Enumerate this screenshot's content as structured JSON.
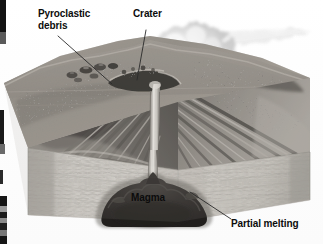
{
  "figure": {
    "type": "labeled-illustration",
    "width": 323,
    "height": 244,
    "background_color": "#ffffff",
    "rendering": "grayscale photographic airbrush illustration"
  },
  "labels": {
    "pyroclastic_debris": "Pyroclastic\ndebris",
    "crater": "Crater",
    "magma": "Magma",
    "partial_melting": "Partial melting"
  },
  "label_color": "#0c0c0c",
  "leader_line_color": "#2a2a2a",
  "parts": {
    "ash_plume": "ash-plume",
    "summit_crater": "summit-crater",
    "volcanic_cone": "volcanic-cone",
    "pyroclastic_layers": "pyroclastic-layers",
    "lava_layers": "lava-layers",
    "central_conduit": "central-conduit",
    "crust_block": "crust-block",
    "magma_chamber": "magma-chamber",
    "partial_melt_zone": "partial-melt-zone",
    "scan_artifact": "left-edge-scan-strip"
  },
  "palette": {
    "sky": "#ffffff",
    "plume_light": "#f0f0f0",
    "plume_mid": "#cfcfcf",
    "cone_light": "#b8b4ae",
    "cone_mid": "#8e8a85",
    "cone_dark": "#5a5752",
    "crust_light": "#d9d6d1",
    "crust_mid": "#c2bfb9",
    "crust_shadow": "#9b9893",
    "magma_dark": "#3a3734",
    "magma_darkest": "#1f1d1b",
    "conduit": "#cdcac5",
    "strip_black": "#111111"
  }
}
